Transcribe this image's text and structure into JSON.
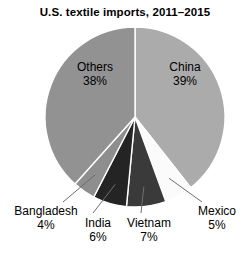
{
  "chart_data": {
    "type": "pie",
    "title": "U.S. textile imports, 2011–2015",
    "subtitle": "",
    "xlabel": "",
    "ylabel": "",
    "legend_position": "none",
    "grid": false,
    "total_percent": 99,
    "start_angle_deg": 0,
    "direction": "clockwise",
    "categories": [
      "China",
      "Mexico",
      "Vietnam",
      "India",
      "Bangladesh",
      "Others"
    ],
    "values": [
      39,
      5,
      7,
      6,
      4,
      38
    ],
    "slices": [
      {
        "name": "China",
        "label": "China",
        "percent": 39,
        "percent_text": "39%",
        "color": "#ababab",
        "label_placement": "inside",
        "leader_line": false
      },
      {
        "name": "Mexico",
        "label": "Mexico",
        "percent": 5,
        "percent_text": "5%",
        "color": "#fbfbfb",
        "label_placement": "outside",
        "leader_line": true
      },
      {
        "name": "Vietnam",
        "label": "Vietnam",
        "percent": 7,
        "percent_text": "7%",
        "color": "#3a3a3a",
        "label_placement": "outside",
        "leader_line": true
      },
      {
        "name": "India",
        "label": "India",
        "percent": 6,
        "percent_text": "6%",
        "color": "#242424",
        "label_placement": "outside",
        "leader_line": true
      },
      {
        "name": "Bangladesh",
        "label": "Bangladesh",
        "percent": 4,
        "percent_text": "4%",
        "color": "#8e8e8e",
        "label_placement": "outside",
        "leader_line": true
      },
      {
        "name": "Others",
        "label": "Others",
        "percent": 38,
        "percent_text": "38%",
        "color": "#929292",
        "label_placement": "inside",
        "leader_line": false
      }
    ],
    "colors": {
      "background": "#ffffff",
      "text": "#000000",
      "slice_outline": "#ffffff",
      "leader_line": "#6e6e6e"
    },
    "geometry": {
      "center_x": 135,
      "center_y": 117,
      "radius": 90
    }
  },
  "footer": {
    "source_note": ""
  }
}
